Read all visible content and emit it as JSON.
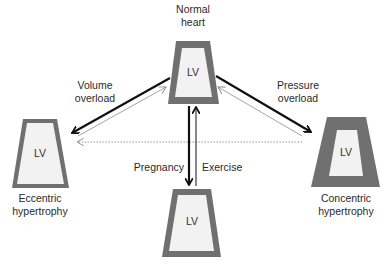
{
  "nodes": {
    "normal": {
      "title_line1": "Normal",
      "title_line2": "heart",
      "chamber": "LV"
    },
    "eccentric": {
      "title_line1": "Eccentric",
      "title_line2": "hypertrophy",
      "chamber": "LV"
    },
    "concentric": {
      "title_line1": "Concentric",
      "title_line2": "hypertrophy",
      "chamber": "LV"
    },
    "physiologic": {
      "chamber": "LV"
    }
  },
  "edges": {
    "volume_overload": {
      "line1": "Volume",
      "line2": "overload"
    },
    "pressure_overload": {
      "line1": "Pressure",
      "line2": "overload"
    },
    "pregnancy": "Pregnancy",
    "exercise": "Exercise"
  },
  "colors": {
    "wall": "#707070",
    "cavity": "#f2f2f2",
    "arrow": "#111111",
    "return_arrow": "#999999"
  }
}
